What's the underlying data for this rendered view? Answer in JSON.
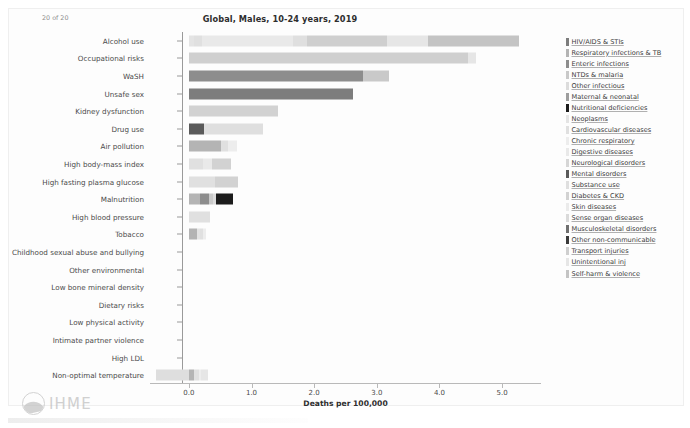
{
  "chart_data": {
    "type": "bar",
    "orientation": "horizontal",
    "stacked": true,
    "title": "Global, Males, 10-24 years, 2019",
    "xlabel": "Deaths per 100,000",
    "ylabel": "",
    "xlim": [
      -0.62,
      5.62
    ],
    "xticks": [
      0.0,
      1.0,
      2.0,
      3.0,
      4.0,
      5.0
    ],
    "xtick_labels": [
      "0.0",
      "1.0",
      "2.0",
      "3.0",
      "4.0",
      "5.0"
    ],
    "grid": false,
    "legend_position": "right",
    "categories": [
      "Alcohol use",
      "Occupational risks",
      "WaSH",
      "Unsafe sex",
      "Kidney dysfunction",
      "Drug use",
      "Air pollution",
      "High body-mass index",
      "High fasting plasma glucose",
      "Malnutrition",
      "High blood pressure",
      "Tobacco",
      "Childhood sexual abuse and bullying",
      "Other environmental",
      "Low bone mineral density",
      "Dietary risks",
      "Low physical activity",
      "Intimate partner violence",
      "High LDL",
      "Non-optimal temperature"
    ],
    "series": [
      {
        "name": "HIV/AIDS & STIs",
        "color": "#7d7d7d",
        "values": [
          0.0,
          0.0,
          0.0,
          2.62,
          0.0,
          0.0,
          0.0,
          0.0,
          0.0,
          0.0,
          0.0,
          0.0,
          0.0,
          0.0,
          0.0,
          0.0,
          0.0,
          0.0,
          0.0,
          0.0
        ]
      },
      {
        "name": "Respiratory infections & TB",
        "color": "#b4b4b4",
        "values": [
          0.0,
          0.0,
          0.0,
          0.0,
          0.0,
          0.0,
          0.52,
          0.0,
          0.0,
          0.18,
          0.0,
          0.13,
          0.0,
          0.0,
          0.0,
          0.0,
          0.0,
          0.0,
          0.0,
          0.09
        ]
      },
      {
        "name": "Enteric infections",
        "color": "#8d8d8d",
        "values": [
          0.0,
          0.0,
          2.78,
          0.0,
          0.0,
          0.0,
          0.0,
          0.0,
          0.0,
          0.14,
          0.0,
          0.0,
          0.0,
          0.0,
          0.0,
          0.0,
          0.0,
          0.0,
          0.0,
          0.0
        ]
      },
      {
        "name": "NTDs & malaria",
        "color": "#c9c9c9",
        "values": [
          0.0,
          0.0,
          0.42,
          0.0,
          0.0,
          0.0,
          0.0,
          0.0,
          0.0,
          0.06,
          0.0,
          0.0,
          0.0,
          0.0,
          0.0,
          0.0,
          0.0,
          0.0,
          0.0,
          0.0
        ]
      },
      {
        "name": "Other infectious",
        "color": "#dcdcdc",
        "values": [
          0.0,
          0.0,
          0.0,
          0.0,
          0.0,
          0.0,
          0.0,
          0.0,
          0.0,
          0.05,
          0.0,
          0.0,
          0.0,
          0.0,
          0.0,
          0.0,
          0.0,
          0.0,
          0.0,
          0.0
        ]
      },
      {
        "name": "Maternal & neonatal",
        "color": "#9e9e9e",
        "values": [
          0.0,
          0.0,
          0.0,
          0.0,
          0.0,
          0.0,
          0.0,
          0.0,
          0.0,
          0.0,
          0.0,
          0.0,
          0.0,
          0.0,
          0.0,
          0.0,
          0.0,
          0.0,
          0.0,
          0.0
        ]
      },
      {
        "name": "Nutritional deficiencies",
        "color": "#1c1c1c",
        "values": [
          0.0,
          0.0,
          0.0,
          0.0,
          0.0,
          0.0,
          0.0,
          0.0,
          0.0,
          0.27,
          0.0,
          0.0,
          0.0,
          0.0,
          0.0,
          0.0,
          0.0,
          0.0,
          0.0,
          0.0
        ]
      },
      {
        "name": "Neoplasms",
        "color": "#e4e4e4",
        "values": [
          0.08,
          0.0,
          0.0,
          0.0,
          0.0,
          0.0,
          0.0,
          0.0,
          0.0,
          0.0,
          0.0,
          0.05,
          0.0,
          0.0,
          0.0,
          0.0,
          0.0,
          0.0,
          0.0,
          0.0
        ]
      },
      {
        "name": "Cardiovascular diseases",
        "color": "#e0e0e0",
        "values": [
          0.13,
          0.0,
          0.0,
          0.0,
          0.0,
          0.0,
          0.1,
          0.22,
          0.42,
          0.0,
          0.33,
          0.05,
          0.0,
          0.0,
          0.0,
          0.0,
          0.0,
          0.0,
          0.0,
          0.07
        ]
      },
      {
        "name": "Chronic respiratory",
        "color": "#ededed",
        "values": [
          0.0,
          0.0,
          0.0,
          0.0,
          0.0,
          0.0,
          0.15,
          0.0,
          0.0,
          0.0,
          0.0,
          0.04,
          0.0,
          0.0,
          0.0,
          0.0,
          0.0,
          0.0,
          0.0,
          0.03
        ]
      },
      {
        "name": "Digestive diseases",
        "color": "#e9e9e9",
        "values": [
          1.45,
          0.0,
          0.0,
          0.0,
          0.0,
          0.0,
          0.0,
          0.15,
          0.0,
          0.0,
          0.0,
          0.0,
          0.0,
          0.0,
          0.0,
          0.0,
          0.0,
          0.0,
          0.0,
          0.0
        ]
      },
      {
        "name": "Neurological disorders",
        "color": "#d6d6d6",
        "values": [
          0.0,
          0.0,
          0.0,
          0.0,
          0.0,
          0.0,
          0.0,
          0.0,
          0.0,
          0.0,
          0.0,
          0.0,
          0.0,
          0.0,
          0.0,
          0.0,
          0.0,
          0.0,
          0.0,
          0.0
        ]
      },
      {
        "name": "Mental disorders",
        "color": "#5a5a5a",
        "values": [
          0.0,
          0.0,
          0.0,
          0.0,
          0.0,
          0.24,
          0.0,
          0.0,
          0.0,
          0.0,
          0.0,
          0.0,
          0.0,
          0.0,
          0.0,
          0.0,
          0.0,
          0.0,
          0.0,
          0.0
        ]
      },
      {
        "name": "Substance use",
        "color": "#dfdfdf",
        "values": [
          0.23,
          0.0,
          0.0,
          0.0,
          0.0,
          0.95,
          0.0,
          0.0,
          0.0,
          0.0,
          0.0,
          0.0,
          0.0,
          0.0,
          0.0,
          0.0,
          0.0,
          0.0,
          0.0,
          0.0
        ]
      },
      {
        "name": "Diabetes & CKD",
        "color": "#d2d2d2",
        "values": [
          0.0,
          0.0,
          0.0,
          0.0,
          1.43,
          0.0,
          0.0,
          0.3,
          0.37,
          0.0,
          0.0,
          0.0,
          0.0,
          0.0,
          0.0,
          0.0,
          0.0,
          0.0,
          0.0,
          0.0
        ]
      },
      {
        "name": "Skin diseases",
        "color": "#ebebeb",
        "values": [
          0.0,
          0.0,
          0.0,
          0.0,
          0.0,
          0.0,
          0.0,
          0.0,
          0.0,
          0.0,
          0.0,
          0.0,
          0.0,
          0.0,
          0.0,
          0.0,
          0.0,
          0.0,
          0.0,
          0.0
        ]
      },
      {
        "name": "Sense organ diseases",
        "color": "#dadada",
        "values": [
          0.0,
          0.0,
          0.0,
          0.0,
          0.0,
          0.0,
          0.0,
          0.0,
          0.0,
          0.0,
          0.0,
          0.0,
          0.0,
          0.0,
          0.0,
          0.0,
          0.0,
          0.0,
          0.0,
          0.0
        ]
      },
      {
        "name": "Musculoskeletal disorders",
        "color": "#6f6f6f",
        "values": [
          0.0,
          0.0,
          0.0,
          0.0,
          0.0,
          0.0,
          0.0,
          0.0,
          0.0,
          0.0,
          0.0,
          0.0,
          0.0,
          0.0,
          0.0,
          0.0,
          0.0,
          0.0,
          0.0,
          0.0
        ]
      },
      {
        "name": "Other non-communicable",
        "color": "#3a3a3a",
        "values": [
          0.0,
          0.0,
          0.0,
          0.0,
          0.0,
          0.0,
          0.0,
          0.0,
          0.0,
          0.0,
          0.0,
          0.0,
          0.0,
          0.0,
          0.0,
          0.0,
          0.0,
          0.0,
          0.0,
          0.0
        ]
      },
      {
        "name": "Transport injuries",
        "color": "#cfcfcf",
        "values": [
          1.28,
          4.45,
          0.0,
          0.0,
          0.0,
          0.0,
          0.0,
          0.0,
          0.0,
          0.0,
          0.0,
          0.0,
          0.0,
          0.0,
          0.0,
          0.0,
          0.0,
          0.0,
          0.0,
          0.0
        ]
      },
      {
        "name": "Unintentional inj",
        "color": "#e6e6e6",
        "values": [
          0.64,
          0.14,
          0.0,
          0.0,
          0.0,
          0.0,
          0.0,
          0.0,
          0.0,
          0.0,
          0.0,
          0.0,
          0.0,
          0.0,
          0.0,
          0.0,
          0.0,
          0.0,
          0.0,
          0.12
        ]
      },
      {
        "name": "Self-harm & violence",
        "color": "#c4c4c4",
        "values": [
          1.46,
          0.0,
          0.0,
          0.0,
          0.0,
          0.0,
          0.0,
          0.0,
          0.0,
          0.0,
          0.0,
          0.0,
          0.0,
          0.0,
          0.0,
          0.0,
          0.0,
          0.0,
          0.0,
          0.0
        ]
      }
    ],
    "bar_totals": [
      5.27,
      4.59,
      3.2,
      2.62,
      1.43,
      1.19,
      0.77,
      0.67,
      0.79,
      0.7,
      0.33,
      0.27,
      0.0,
      0.0,
      0.0,
      0.0,
      0.0,
      0.0,
      0.0,
      0.31
    ],
    "negative_extent": {
      "Non-optimal temperature": -0.52
    }
  },
  "watermark": {
    "brand": "IHME",
    "counter": "20 of 20"
  }
}
